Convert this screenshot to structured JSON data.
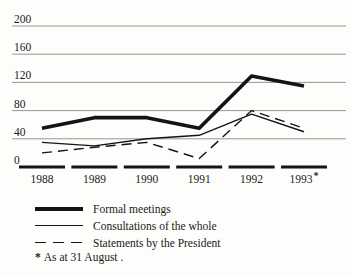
{
  "colors": {
    "background": "#fdfdfb",
    "line": "#141414",
    "grid": "#8a8a86",
    "text": "#1a1a1a"
  },
  "chart_data": {
    "type": "line",
    "title": "",
    "xlabel": "",
    "ylabel": "",
    "ylim": [
      0,
      200
    ],
    "y_ticks": [
      200,
      160,
      120,
      80,
      40,
      0
    ],
    "grid": "horizontal",
    "x_labels": [
      "1988",
      "1989",
      "1990",
      "1991",
      "1992",
      "1993"
    ],
    "x_label_note_index": 5,
    "note_marker": "*",
    "legend_position": "bottom-left",
    "series": [
      {
        "name": "Formal meetings",
        "style": "thick-solid",
        "values": [
          55,
          70,
          70,
          55,
          129,
          115
        ]
      },
      {
        "name": "Consultations of the whole",
        "style": "thin-solid",
        "values": [
          35,
          30,
          40,
          45,
          75,
          50
        ]
      },
      {
        "name": "Statements by the President",
        "style": "dashed",
        "values": [
          20,
          28,
          35,
          12,
          80,
          55
        ]
      }
    ],
    "footnote": "* As at 31 August ."
  },
  "footnote": {
    "marker": "*",
    "text": "As at 31 August ."
  }
}
